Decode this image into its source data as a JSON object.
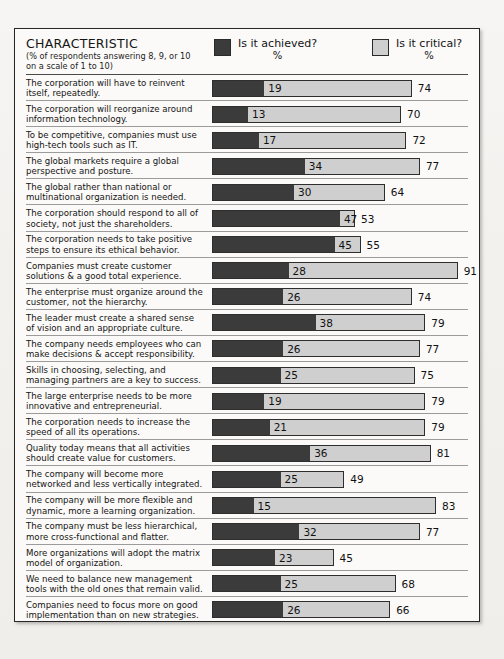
{
  "header": {
    "title": "CHARACTERISTIC",
    "subtitle_line1": "(% of respondents answering 8, 9, or 10",
    "subtitle_line2": "on a scale of 1 to 10)",
    "legend": [
      {
        "key": "achieved",
        "label": "Is it achieved?",
        "unit": "%",
        "color": "#3b3b3b"
      },
      {
        "key": "critical",
        "label": "Is it critical?",
        "unit": "%",
        "color": "#cfcfcf"
      }
    ]
  },
  "scale": {
    "max_percent": 100,
    "bar_px_per_percent": 2.7,
    "bar_origin_px": 207
  },
  "chart_data": {
    "type": "bar",
    "title": "CHARACTERISTIC",
    "subtitle": "(% of respondents answering 8, 9, or 10 on a scale of 1 to 10)",
    "orientation": "horizontal",
    "stacked": "overlay",
    "xlabel": "%",
    "ylabel": "",
    "xlim": [
      0,
      100
    ],
    "grid": false,
    "legend_position": "top",
    "series": [
      {
        "name": "Is it achieved?",
        "unit": "%",
        "color": "#3b3b3b",
        "values": [
          19,
          13,
          17,
          34,
          30,
          47,
          45,
          28,
          26,
          38,
          26,
          25,
          19,
          21,
          36,
          25,
          15,
          32,
          23,
          25,
          26
        ]
      },
      {
        "name": "Is it critical?",
        "unit": "%",
        "color": "#cfcfcf",
        "values": [
          74,
          70,
          72,
          77,
          64,
          53,
          55,
          91,
          74,
          79,
          77,
          75,
          79,
          79,
          81,
          49,
          83,
          77,
          45,
          68,
          66
        ]
      }
    ],
    "categories": [
      "The corporation will have to reinvent itself, repeatedly.",
      "The corporation will reorganize around information technology.",
      "To be competitive, companies must use high-tech tools such as IT.",
      "The global markets require a global perspective and posture.",
      "The global rather than national or multinational organization is needed.",
      "The corporation should respond to all of society, not just the shareholders.",
      "The corporation needs to take positive steps to ensure its ethical behavior.",
      "Companies must create customer solutions & a good total experience.",
      "The enterprise must organize around the customer, not the hierarchy.",
      "The leader must create a shared sense of vision and an appropriate culture.",
      "The company needs employees who can make decisions & accept responsibility.",
      "Skills in choosing, selecting, and managing partners are a key to success.",
      "The large enterprise needs to be more innovative and entrepreneurial.",
      "The corporation needs to increase the speed of all its operations.",
      "Quality today means that all activities should create value for customers.",
      "The company will become more networked and less vertically integrated.",
      "The company will be more flexible and dynamic, more a learning organization.",
      "The company must be less hierarchical, more cross-functional and flatter.",
      "More organizations will adopt the matrix model of organization.",
      "We need to balance new management tools with the old ones that remain valid.",
      "Companies need to focus more on good implementation than on new strategies."
    ]
  },
  "rows": [
    {
      "line1": "The corporation will have to reinvent",
      "line2": "itself, repeatedly.",
      "achieved": 19,
      "critical": 74
    },
    {
      "line1": "The corporation will reorganize around",
      "line2": "information technology.",
      "achieved": 13,
      "critical": 70
    },
    {
      "line1": "To be competitive, companies must use",
      "line2": "high-tech tools such as IT.",
      "achieved": 17,
      "critical": 72
    },
    {
      "line1": "The global markets require a global",
      "line2": "perspective and posture.",
      "achieved": 34,
      "critical": 77
    },
    {
      "line1": "The global rather than national or",
      "line2": "multinational organization is needed.",
      "achieved": 30,
      "critical": 64
    },
    {
      "line1": "The corporation should respond to all of",
      "line2": "society, not just the shareholders.",
      "achieved": 47,
      "critical": 53
    },
    {
      "line1": "The corporation needs to take positive",
      "line2": "steps to ensure its ethical behavior.",
      "achieved": 45,
      "critical": 55
    },
    {
      "line1": "Companies must create customer",
      "line2": "solutions & a good total experience.",
      "achieved": 28,
      "critical": 91
    },
    {
      "line1": "The enterprise must organize around the",
      "line2": "customer, not the hierarchy.",
      "achieved": 26,
      "critical": 74
    },
    {
      "line1": "The leader must create a shared sense",
      "line2": "of vision and an appropriate culture.",
      "achieved": 38,
      "critical": 79
    },
    {
      "line1": "The company needs employees who can",
      "line2": "make decisions & accept responsibility.",
      "achieved": 26,
      "critical": 77
    },
    {
      "line1": "Skills in choosing, selecting, and",
      "line2": "managing partners are a key to success.",
      "achieved": 25,
      "critical": 75
    },
    {
      "line1": "The large enterprise needs to be more",
      "line2": "innovative and entrepreneurial.",
      "achieved": 19,
      "critical": 79
    },
    {
      "line1": "The corporation needs to increase the",
      "line2": "speed of all its operations.",
      "achieved": 21,
      "critical": 79
    },
    {
      "line1": "Quality today means that all activities",
      "line2": "should create value for customers.",
      "achieved": 36,
      "critical": 81
    },
    {
      "line1": "The company will become more",
      "line2": "networked and less vertically integrated.",
      "achieved": 25,
      "critical": 49
    },
    {
      "line1": "The company will be more flexible and",
      "line2": "dynamic, more a learning organization.",
      "achieved": 15,
      "critical": 83
    },
    {
      "line1": "The company must be less hierarchical,",
      "line2": "more cross-functional and flatter.",
      "achieved": 32,
      "critical": 77
    },
    {
      "line1": "More organizations will adopt the matrix",
      "line2": "model of organization.",
      "achieved": 23,
      "critical": 45
    },
    {
      "line1": "We need to balance new management",
      "line2": "tools with the old ones that remain valid.",
      "achieved": 25,
      "critical": 68
    },
    {
      "line1": "Companies need to focus more on good",
      "line2": "implementation than on new strategies.",
      "achieved": 26,
      "critical": 66
    }
  ]
}
